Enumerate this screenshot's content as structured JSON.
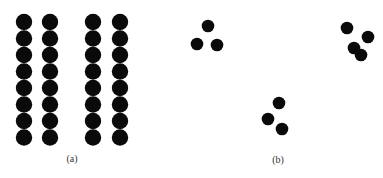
{
  "figure": {
    "panels": [
      {
        "label": "(a)",
        "label_pos": [
          72,
          162
        ],
        "description": "Four columns of eight overlapping dots in a regular grid",
        "dot_radius": 8.2,
        "columns_x": [
          24,
          50,
          93,
          120
        ],
        "rows_y": [
          22,
          38.5,
          55,
          71.5,
          88,
          104.5,
          121,
          137.5
        ]
      },
      {
        "label": "(b)",
        "label_pos": [
          278,
          163
        ],
        "description": "Three scattered clusters of dots",
        "dot_radius": 6.3,
        "clusters": [
          {
            "name": "top-left",
            "dots": [
              [
                208,
                26
              ],
              [
                197,
                44
              ],
              [
                217,
                45
              ]
            ]
          },
          {
            "name": "top-right",
            "dots": [
              [
                347,
                28
              ],
              [
                368,
                37
              ],
              [
                354,
                48
              ],
              [
                361,
                55
              ]
            ]
          },
          {
            "name": "bottom",
            "dots": [
              [
                279,
                103
              ],
              [
                268,
                119
              ],
              [
                282,
                129
              ]
            ]
          }
        ]
      }
    ],
    "dot_color": "#0a0a0a"
  }
}
